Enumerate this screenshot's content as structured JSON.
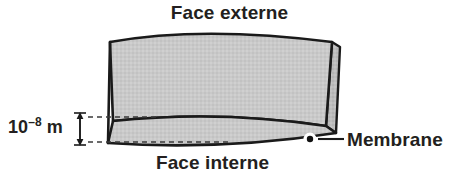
{
  "figure": {
    "background_color": "#ffffff",
    "labels": {
      "outer_face": "Face externe",
      "inner_face": "Face interne",
      "membrane": "Membrane",
      "thickness_mantissa": "10",
      "thickness_exponent": "–8",
      "thickness_unit": "m",
      "thickness_full": "10–8 m"
    },
    "colors": {
      "slab_fill": "#c9c9c9",
      "edge_fill": "#b9b9b9",
      "band_fill": "#c4c4c4",
      "outline": "#1a1a1a",
      "text": "#231f20",
      "dashed_guide": "#444444",
      "marker_dot": "#111111",
      "marker_halo": "#ffffff"
    },
    "geometry": {
      "slab_top_arc_peak_y": 33,
      "slab_left_x": 108,
      "slab_right_x": 340,
      "slab_bottom_y": 147,
      "thickness_band_top_y": 118,
      "thickness_band_bottom_y": 143,
      "dimension_line_x": 80,
      "dimension_top_y": 115,
      "dimension_bottom_y": 142,
      "marker_dot_x": 310,
      "marker_dot_y": 139,
      "leader_line_end_x": 344
    }
  }
}
